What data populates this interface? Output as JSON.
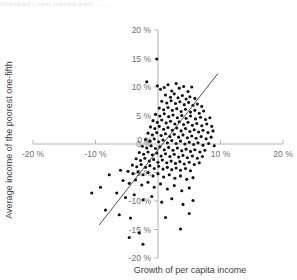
{
  "figure": {
    "caption_fragment": "(Granulated Lorentz scanning graph ...........",
    "background_color": "#ffffff"
  },
  "chart_data": {
    "type": "scatter",
    "title": "",
    "subtitle": "",
    "xlabel": "Growth of per capita income",
    "ylabel": "Average income of the poorest one-fifth",
    "xlim": [
      -20,
      20
    ],
    "ylim": [
      -20,
      20
    ],
    "grid": false,
    "legend": null,
    "legend_position": "none",
    "axis_color": "#b6b6ba",
    "point_color": "#131316",
    "trend_color": "#3a3a3e",
    "xticks": [
      -20,
      -10,
      0,
      10,
      20
    ],
    "xtick_labels": [
      "-20 %",
      "-10 %",
      "0 %",
      "10 %",
      "20 %"
    ],
    "yticks": [
      -20,
      -15,
      -10,
      -5,
      0,
      5,
      10,
      15,
      20
    ],
    "ytick_labels": [
      "-20 %",
      "-15 %",
      "-10 %",
      "-5 %",
      "0 %",
      "5 %",
      "10 %",
      "15 %",
      "20 %"
    ],
    "trend_line": {
      "x0": -9.4,
      "y0": -14.2,
      "x1": 9.6,
      "y1": 12.4
    },
    "n_points": 204,
    "points": [
      [
        -0.2,
        14.9
      ],
      [
        -1.8,
        10.9
      ],
      [
        -0.1,
        10.2
      ],
      [
        0.4,
        9.6
      ],
      [
        1.0,
        9.9
      ],
      [
        1.6,
        10.4
      ],
      [
        2.2,
        9.3
      ],
      [
        2.9,
        10.6
      ],
      [
        3.4,
        9.8
      ],
      [
        4.1,
        10.1
      ],
      [
        4.8,
        9.2
      ],
      [
        5.4,
        10.0
      ],
      [
        1.2,
        8.6
      ],
      [
        2.0,
        8.2
      ],
      [
        2.6,
        8.8
      ],
      [
        3.2,
        8.1
      ],
      [
        3.9,
        8.5
      ],
      [
        4.5,
        7.9
      ],
      [
        5.1,
        8.3
      ],
      [
        5.9,
        8.0
      ],
      [
        0.6,
        7.5
      ],
      [
        1.4,
        7.2
      ],
      [
        2.1,
        7.6
      ],
      [
        2.8,
        7.1
      ],
      [
        3.5,
        7.4
      ],
      [
        4.2,
        6.9
      ],
      [
        4.9,
        7.3
      ],
      [
        5.6,
        6.8
      ],
      [
        6.3,
        7.0
      ],
      [
        7.0,
        6.6
      ],
      [
        0.2,
        6.3
      ],
      [
        0.9,
        6.0
      ],
      [
        1.6,
        6.4
      ],
      [
        2.3,
        5.9
      ],
      [
        3.0,
        6.2
      ],
      [
        3.7,
        5.7
      ],
      [
        4.4,
        6.1
      ],
      [
        5.2,
        5.6
      ],
      [
        5.9,
        5.9
      ],
      [
        6.6,
        5.4
      ],
      [
        7.3,
        5.8
      ],
      [
        -0.4,
        5.2
      ],
      [
        0.3,
        4.9
      ],
      [
        1.0,
        5.3
      ],
      [
        1.7,
        4.8
      ],
      [
        2.4,
        5.1
      ],
      [
        3.1,
        4.6
      ],
      [
        3.8,
        5.0
      ],
      [
        4.5,
        4.5
      ],
      [
        5.2,
        4.9
      ],
      [
        6.0,
        4.4
      ],
      [
        6.8,
        4.7
      ],
      [
        7.6,
        4.3
      ],
      [
        8.3,
        4.6
      ],
      [
        -0.8,
        4.1
      ],
      [
        -0.1,
        3.8
      ],
      [
        0.6,
        4.2
      ],
      [
        1.3,
        3.7
      ],
      [
        2.0,
        4.0
      ],
      [
        2.7,
        3.5
      ],
      [
        3.4,
        3.9
      ],
      [
        4.1,
        3.4
      ],
      [
        4.8,
        3.8
      ],
      [
        5.5,
        3.3
      ],
      [
        6.2,
        3.6
      ],
      [
        7.0,
        3.2
      ],
      [
        7.8,
        3.5
      ],
      [
        8.6,
        3.1
      ],
      [
        -1.2,
        3.0
      ],
      [
        -0.5,
        2.7
      ],
      [
        0.2,
        3.1
      ],
      [
        0.9,
        2.6
      ],
      [
        1.6,
        2.9
      ],
      [
        2.3,
        2.4
      ],
      [
        3.0,
        2.8
      ],
      [
        3.7,
        2.3
      ],
      [
        4.4,
        2.7
      ],
      [
        5.1,
        2.2
      ],
      [
        5.8,
        2.5
      ],
      [
        6.5,
        2.1
      ],
      [
        7.2,
        2.4
      ],
      [
        8.0,
        2.0
      ],
      [
        8.8,
        2.3
      ],
      [
        -1.6,
        1.9
      ],
      [
        -0.9,
        1.6
      ],
      [
        -0.2,
        2.0
      ],
      [
        0.5,
        1.5
      ],
      [
        1.2,
        1.8
      ],
      [
        1.9,
        1.3
      ],
      [
        2.6,
        1.7
      ],
      [
        3.3,
        1.2
      ],
      [
        4.0,
        1.6
      ],
      [
        4.7,
        1.1
      ],
      [
        5.4,
        1.4
      ],
      [
        6.1,
        1.0
      ],
      [
        6.9,
        1.3
      ],
      [
        7.7,
        0.9
      ],
      [
        8.5,
        1.2
      ],
      [
        -2.0,
        0.8
      ],
      [
        -1.3,
        0.5
      ],
      [
        -0.6,
        0.9
      ],
      [
        0.1,
        0.4
      ],
      [
        0.8,
        0.7
      ],
      [
        1.5,
        0.2
      ],
      [
        2.2,
        0.6
      ],
      [
        2.9,
        0.1
      ],
      [
        3.6,
        0.5
      ],
      [
        4.3,
        0.0
      ],
      [
        5.0,
        0.3
      ],
      [
        5.7,
        -0.1
      ],
      [
        6.4,
        0.2
      ],
      [
        7.2,
        -0.2
      ],
      [
        8.1,
        0.1
      ],
      [
        9.0,
        -0.3
      ],
      [
        -2.5,
        -0.4
      ],
      [
        -1.8,
        -0.7
      ],
      [
        -1.1,
        -0.3
      ],
      [
        -0.4,
        -0.8
      ],
      [
        0.3,
        -0.5
      ],
      [
        1.0,
        -1.0
      ],
      [
        1.7,
        -0.6
      ],
      [
        2.4,
        -1.1
      ],
      [
        3.1,
        -0.7
      ],
      [
        3.8,
        -1.2
      ],
      [
        4.5,
        -0.9
      ],
      [
        5.2,
        -1.3
      ],
      [
        5.9,
        -1.0
      ],
      [
        6.7,
        -1.4
      ],
      [
        7.5,
        -1.1
      ],
      [
        -3.0,
        -1.5
      ],
      [
        -2.3,
        -1.8
      ],
      [
        -1.6,
        -1.4
      ],
      [
        -0.9,
        -1.9
      ],
      [
        -0.2,
        -1.6
      ],
      [
        0.5,
        -2.1
      ],
      [
        1.2,
        -1.7
      ],
      [
        1.9,
        -2.2
      ],
      [
        2.6,
        -1.8
      ],
      [
        3.3,
        -2.3
      ],
      [
        4.0,
        -2.0
      ],
      [
        4.7,
        -2.4
      ],
      [
        5.5,
        -2.1
      ],
      [
        6.3,
        -2.5
      ],
      [
        7.1,
        -2.2
      ],
      [
        -3.5,
        -2.6
      ],
      [
        -2.8,
        -2.9
      ],
      [
        -2.1,
        -2.5
      ],
      [
        -1.4,
        -3.0
      ],
      [
        -0.7,
        -2.7
      ],
      [
        0.0,
        -3.2
      ],
      [
        0.7,
        -2.8
      ],
      [
        1.4,
        -3.3
      ],
      [
        2.1,
        -3.0
      ],
      [
        2.8,
        -3.4
      ],
      [
        3.5,
        -3.1
      ],
      [
        4.2,
        -3.5
      ],
      [
        5.0,
        -3.2
      ],
      [
        5.8,
        -3.6
      ],
      [
        6.6,
        -3.3
      ],
      [
        -4.1,
        -3.7
      ],
      [
        -3.4,
        -4.0
      ],
      [
        -2.7,
        -3.6
      ],
      [
        -2.0,
        -4.1
      ],
      [
        -1.3,
        -3.8
      ],
      [
        -0.6,
        -4.3
      ],
      [
        0.1,
        -3.9
      ],
      [
        0.8,
        -4.4
      ],
      [
        1.5,
        -4.1
      ],
      [
        2.2,
        -4.5
      ],
      [
        2.9,
        -4.2
      ],
      [
        3.6,
        -4.6
      ],
      [
        4.4,
        -4.3
      ],
      [
        5.2,
        -4.7
      ],
      [
        -4.8,
        -4.8
      ],
      [
        -4.0,
        -5.2
      ],
      [
        -3.2,
        -4.9
      ],
      [
        -2.4,
        -5.4
      ],
      [
        -1.6,
        -5.0
      ],
      [
        -0.8,
        -5.6
      ],
      [
        0.0,
        -5.2
      ],
      [
        0.9,
        -5.8
      ],
      [
        1.8,
        -5.4
      ],
      [
        2.7,
        -6.0
      ],
      [
        3.6,
        -5.6
      ],
      [
        4.6,
        -6.2
      ],
      [
        5.6,
        -5.9
      ],
      [
        -5.6,
        -6.4
      ],
      [
        -4.6,
        -6.9
      ],
      [
        -3.6,
        -6.3
      ],
      [
        -2.6,
        -7.2
      ],
      [
        -1.6,
        -6.7
      ],
      [
        -0.6,
        -7.6
      ],
      [
        0.4,
        -7.0
      ],
      [
        1.5,
        -7.9
      ],
      [
        2.6,
        -7.3
      ],
      [
        3.8,
        -8.2
      ],
      [
        5.0,
        -7.7
      ],
      [
        -6.6,
        -8.6
      ],
      [
        -5.2,
        -9.4
      ],
      [
        -3.8,
        -8.9
      ],
      [
        -2.4,
        -9.8
      ],
      [
        -1.0,
        -9.2
      ],
      [
        0.6,
        -10.2
      ],
      [
        2.2,
        -9.6
      ],
      [
        4.0,
        -10.6
      ],
      [
        5.6,
        -9.9
      ],
      [
        -8.4,
        -11.6
      ],
      [
        -6.2,
        -12.4
      ],
      [
        -4.4,
        -13.0
      ],
      [
        -3.0,
        -15.6
      ],
      [
        -4.6,
        -16.4
      ],
      [
        -2.4,
        -17.6
      ],
      [
        1.2,
        -12.9
      ],
      [
        3.6,
        -14.9
      ],
      [
        5.0,
        -12.2
      ],
      [
        -10.6,
        -8.6
      ],
      [
        -7.8,
        -5.4
      ],
      [
        -6.0,
        -4.6
      ],
      [
        -9.2,
        -7.6
      ]
    ]
  }
}
